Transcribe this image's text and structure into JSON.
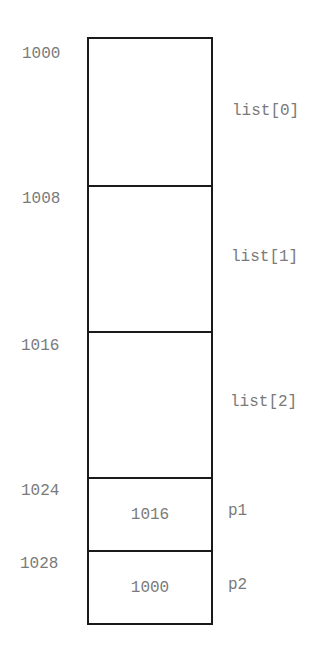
{
  "diagram": {
    "title": "",
    "cells": [
      {
        "address": "1000",
        "value": "",
        "label": "list[0]"
      },
      {
        "address": "1008",
        "value": "",
        "label": "list[1]"
      },
      {
        "address": "1016",
        "value": "",
        "label": "list[2]"
      },
      {
        "address": "1024",
        "value": "1016",
        "label": "p1"
      },
      {
        "address": "1028",
        "value": "1000",
        "label": "p2"
      }
    ]
  }
}
